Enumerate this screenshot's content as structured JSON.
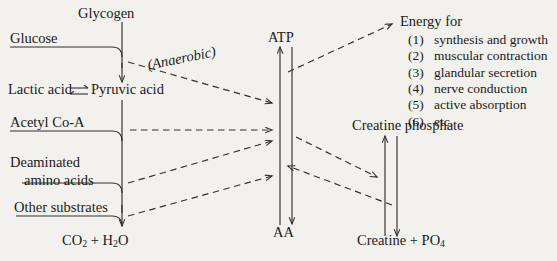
{
  "diagram": {
    "background_color": "#f2f1ee",
    "ink_color": "#33302e"
  },
  "nodes": {
    "glycogen": "Glycogen",
    "glucose": "Glucose",
    "lactic_acid": "Lactic acid",
    "equilibrium_symbol": "⇌",
    "pyruvic_acid": "Pyruvic acid",
    "acetyl_coa": "Acetyl Co-A",
    "deaminated_line1": "Deaminated",
    "deaminated_line2": "amino acids",
    "other_substrates": "Other substrates",
    "co2_h2o_prefix": "CO",
    "co2_sub": "2",
    "plus": "+",
    "h2o_prefix": "H",
    "h2o_sub": "2",
    "h2o_suffix": "O",
    "atp": "ATP",
    "aa": "AA",
    "creatine_phosphate": "Creatine phosphate",
    "creatine_prefix": "Creatine",
    "creatine_plus": "+",
    "po4_prefix": "PO",
    "po4_sub": "4"
  },
  "annotations": {
    "anaerobic": "(Anaerobic)"
  },
  "energy": {
    "heading": "Energy for",
    "items": [
      {
        "num": "(1)",
        "label": "synthesis and growth"
      },
      {
        "num": "(2)",
        "label": "muscular contraction"
      },
      {
        "num": "(3)",
        "label": "glandular secretion"
      },
      {
        "num": "(4)",
        "label": "nerve conduction"
      },
      {
        "num": "(5)",
        "label": "active absorption"
      },
      {
        "num": "(6)",
        "label": "etc."
      }
    ]
  },
  "chart_data": {
    "type": "diagram",
    "nodes": [
      "Glycogen",
      "Glucose",
      "Lactic acid",
      "Pyruvic acid",
      "Acetyl Co-A",
      "Deaminated amino acids",
      "Other substrates",
      "CO2 + H2O",
      "ATP",
      "AA",
      "Creatine phosphate",
      "Creatine + PO4",
      "Energy for"
    ],
    "edges": [
      {
        "from": "Glycogen",
        "to": "Pyruvic acid",
        "style": "solid",
        "arrow": "down"
      },
      {
        "from": "Glucose",
        "to": "Pyruvic acid",
        "style": "solid",
        "arrow": "down"
      },
      {
        "from": "Lactic acid",
        "to": "Pyruvic acid",
        "style": "solid",
        "arrow": "reversible",
        "symbol": "⇌"
      },
      {
        "from": "Pyruvic acid",
        "to": "ATP",
        "style": "dashed",
        "arrow": "right",
        "label": "(Anaerobic)"
      },
      {
        "from": "Acetyl Co-A",
        "to": "ATP",
        "style": "dashed",
        "arrow": "right"
      },
      {
        "from": "Deaminated amino acids",
        "to": "ATP",
        "style": "dashed",
        "arrow": "right"
      },
      {
        "from": "Other substrates",
        "to": "ATP",
        "style": "dashed",
        "arrow": "right"
      },
      {
        "from": "Pyruvic acid",
        "to": "CO2 + H2O",
        "style": "solid",
        "arrow": "down"
      },
      {
        "from": "Acetyl Co-A",
        "to": "CO2 + H2O",
        "style": "solid",
        "arrow": "down"
      },
      {
        "from": "Deaminated amino acids",
        "to": "CO2 + H2O",
        "style": "solid",
        "arrow": "down"
      },
      {
        "from": "Other substrates",
        "to": "CO2 + H2O",
        "style": "solid",
        "arrow": "down"
      },
      {
        "from": "AA",
        "to": "ATP",
        "style": "solid",
        "arrow": "up"
      },
      {
        "from": "ATP",
        "to": "AA",
        "style": "solid",
        "arrow": "down"
      },
      {
        "from": "ATP",
        "to": "Energy for",
        "style": "dashed",
        "arrow": "up-right"
      },
      {
        "from": "ATP",
        "to": "Creatine phosphate",
        "style": "dashed",
        "arrow": "right-down"
      },
      {
        "from": "Creatine phosphate",
        "to": "ATP",
        "style": "dashed",
        "arrow": "left-up"
      },
      {
        "from": "Creatine + PO4",
        "to": "Creatine phosphate",
        "style": "solid",
        "arrow": "up"
      },
      {
        "from": "Creatine phosphate",
        "to": "Creatine + PO4",
        "style": "solid",
        "arrow": "down"
      }
    ]
  }
}
